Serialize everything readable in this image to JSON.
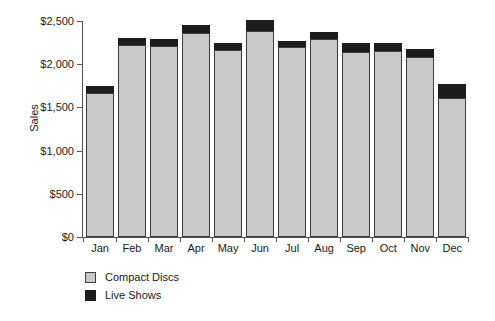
{
  "chart_data": {
    "type": "bar",
    "stacked": true,
    "title": "",
    "xlabel": "",
    "ylabel": "Sales",
    "ylim": [
      0,
      2500
    ],
    "ytick_values": [
      0,
      500,
      1000,
      1500,
      2000,
      2500
    ],
    "ytick_labels": [
      "$0",
      "$500",
      "$1,000",
      "$1,500",
      "$2,000",
      "$2,500"
    ],
    "grid": false,
    "legend_position": "bottom-left",
    "categories": [
      "Jan",
      "Feb",
      "Mar",
      "Apr",
      "May",
      "Jun",
      "Jul",
      "Aug",
      "Sep",
      "Oct",
      "Nov",
      "Dec"
    ],
    "series": [
      {
        "name": "Compact Discs",
        "color": "#c9c9c9",
        "values": [
          1670,
          2220,
          2215,
          2360,
          2160,
          2385,
          2195,
          2290,
          2140,
          2150,
          2080,
          1610
        ]
      },
      {
        "name": "Live Shows",
        "color": "#1c1c1c",
        "values": [
          80,
          85,
          80,
          90,
          85,
          125,
          75,
          85,
          100,
          90,
          100,
          165
        ]
      }
    ],
    "totals": [
      1750,
      2305,
      2295,
      2450,
      2245,
      2510,
      2270,
      2375,
      2240,
      2240,
      2180,
      1775
    ]
  },
  "legend": {
    "items": [
      {
        "label": "Compact Discs",
        "swatch": "legend-swatch-compact-discs"
      },
      {
        "label": "Live Shows",
        "swatch": "legend-swatch-live-shows"
      }
    ]
  },
  "colors": {
    "compact_discs": "#c9c9c9",
    "live_shows": "#1c1c1c",
    "axis": "#555555",
    "bar_outline": "#3d3d3d",
    "text": "#1a1a1a",
    "background": "#ffffff"
  }
}
